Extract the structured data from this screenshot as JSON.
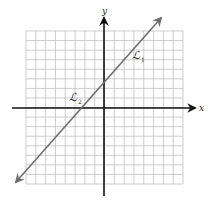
{
  "diagram": {
    "type": "coordinate-plane",
    "grid": {
      "columns": 16,
      "rows": 16,
      "color": "#b8b8b8"
    },
    "axes": {
      "x_label": "x",
      "y_label": "y",
      "color": "#111111"
    },
    "line": {
      "color": "#6e6e6e",
      "description": "single line with arrows on both ends, positive slope ~1, crossing x-axis near -2.5 and y-axis near 2.5",
      "labels": [
        {
          "text": "ℒ",
          "subscript": "1"
        },
        {
          "text": "ℒ",
          "subscript": "2"
        }
      ]
    }
  }
}
